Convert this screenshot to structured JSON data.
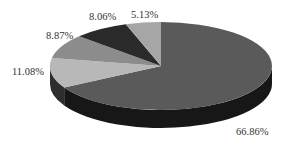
{
  "chart_data": {
    "type": "pie",
    "style": "3d",
    "title": "",
    "categories": [
      "A",
      "B",
      "C",
      "D",
      "E"
    ],
    "values": [
      66.86,
      11.08,
      8.87,
      8.06,
      5.13
    ],
    "labels": [
      "66.86%",
      "11.08%",
      "8.87%",
      "8.06%",
      "5.13%"
    ],
    "colors": [
      "#5a5a5a",
      "#b8b8b8",
      "#8c8c8c",
      "#2a2a2a",
      "#a6a6a6"
    ],
    "legend": "none"
  },
  "labels": {
    "l0": "66.86%",
    "l1": "11.08%",
    "l2": "8.87%",
    "l3": "8.06%",
    "l4": "5.13%"
  }
}
